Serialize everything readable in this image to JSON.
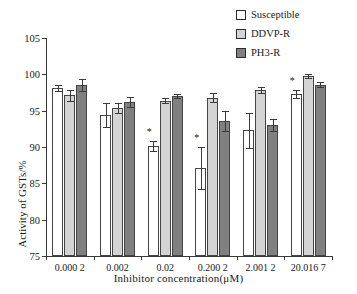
{
  "chart_data": {
    "type": "bar",
    "title": "",
    "xlabel": "Inhibitor concentration(μM)",
    "ylabel": "Activity of GSTs/%",
    "ylim": [
      75,
      105
    ],
    "yticks": [
      75,
      80,
      85,
      90,
      95,
      100,
      105
    ],
    "ytick_labels": [
      "75",
      "80",
      "85",
      "90",
      "95",
      "100",
      "105"
    ],
    "grid": false,
    "legend_position": "top-right",
    "categories": [
      "0.000 2",
      "0.002",
      "0.02",
      "0.200 2",
      "2.001 2",
      "20.016 7"
    ],
    "series": [
      {
        "name": "Susceptible",
        "color": "#ffffff",
        "values": [
          98.1,
          94.4,
          90.1,
          87.1,
          92.3,
          97.3
        ],
        "errors": [
          0.4,
          1.7,
          0.7,
          2.9,
          2.4,
          0.5
        ],
        "annotations": [
          "",
          "",
          "*",
          "*",
          "",
          "*"
        ]
      },
      {
        "name": "DDVP-R",
        "color": "#d4d4d4",
        "values": [
          97.1,
          95.4,
          96.4,
          96.8,
          97.8,
          99.8
        ],
        "errors": [
          0.8,
          0.7,
          0.4,
          0.6,
          0.4,
          0.3
        ],
        "annotations": [
          "",
          "",
          "",
          "",
          "",
          ""
        ]
      },
      {
        "name": "PH3-R",
        "color": "#808080",
        "values": [
          98.5,
          96.2,
          97.0,
          93.6,
          93.0,
          98.6
        ],
        "errors": [
          0.8,
          0.7,
          0.3,
          1.4,
          0.8,
          0.4
        ],
        "annotations": [
          "",
          "",
          "",
          "",
          "",
          ""
        ]
      }
    ]
  },
  "legend": {
    "items": [
      {
        "label": "Susceptible",
        "swatch": "white-swatch"
      },
      {
        "label": "DDVP-R",
        "swatch": "light-gray-swatch"
      },
      {
        "label": "PH3-R",
        "swatch": "dark-gray-swatch"
      }
    ]
  },
  "axes": {
    "y_title": "Activity of GSTs/%",
    "x_title": "Inhibitor concentration(μM)"
  }
}
